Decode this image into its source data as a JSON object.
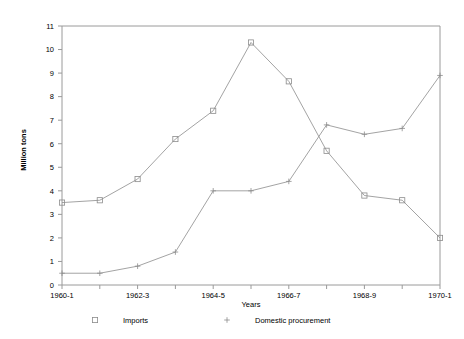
{
  "chart_data": {
    "type": "line",
    "title": "",
    "xlabel": "Years",
    "ylabel": "Million tons",
    "ylim": [
      0,
      11
    ],
    "grid": false,
    "legend_position": "bottom",
    "x": [
      "1960-1",
      "1961-2",
      "1962-3",
      "1963-4",
      "1964-5",
      "1965-6",
      "1966-7",
      "1967-8",
      "1968-9",
      "1969-70",
      "1970-1"
    ],
    "categories": [
      "1960-1",
      "1961-2",
      "1962-3",
      "1963-4",
      "1964-5",
      "1965-6",
      "1966-7",
      "1967-8",
      "1968-9",
      "1969-70",
      "1970-1"
    ],
    "x_tick_labels": [
      "1960-1",
      "1962-3",
      "1964-5",
      "1966-7",
      "1968-9",
      "1970-1"
    ],
    "y_tick_labels": [
      "0",
      "1",
      "2",
      "3",
      "4",
      "5",
      "6",
      "7",
      "8",
      "9",
      "10",
      "11"
    ],
    "series": [
      {
        "name": "Imports",
        "marker": "square",
        "values": [
          3.5,
          3.6,
          4.5,
          6.2,
          7.4,
          10.3,
          8.65,
          5.7,
          3.8,
          3.6,
          2.0
        ]
      },
      {
        "name": "Domestic procurement",
        "marker": "plus",
        "values": [
          0.5,
          0.5,
          0.8,
          1.4,
          4.0,
          4.0,
          4.4,
          6.8,
          6.4,
          6.65,
          8.9
        ]
      }
    ]
  },
  "legend": {
    "entries": [
      {
        "label": "Imports",
        "marker": "square-marker-icon"
      },
      {
        "label": "Domestic procurement",
        "marker": "plus-marker-icon"
      }
    ]
  },
  "colors": {
    "line": "#8c8c8c",
    "axis": "#9a9a9a",
    "text": "#000000",
    "background": "#ffffff"
  }
}
